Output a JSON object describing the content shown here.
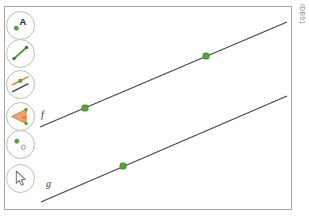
{
  "figure_id": "IDB91",
  "toolbar": {
    "tools": [
      {
        "name": "point-tool",
        "icon": "point-with-label-icon",
        "label": "A"
      },
      {
        "name": "segment-tool",
        "icon": "segment-icon",
        "label": ""
      },
      {
        "name": "parallel-line-tool",
        "icon": "parallel-lines-icon",
        "label": ""
      },
      {
        "name": "angle-tool",
        "icon": "angle-icon",
        "label": "α"
      },
      {
        "name": "point-on-object-tool",
        "icon": "point-on-object-icon",
        "label": ""
      },
      {
        "name": "move-tool",
        "icon": "cursor-arrow-icon",
        "label": ""
      }
    ]
  },
  "canvas": {
    "lines": [
      {
        "label": "f",
        "x1": 40,
        "y1": 127,
        "x2": 287,
        "y2": 22,
        "label_x": 41,
        "label_y": 118
      },
      {
        "label": "g",
        "x1": 41,
        "y1": 202,
        "x2": 287,
        "y2": 96,
        "label_x": 46,
        "label_y": 187
      }
    ],
    "points": [
      {
        "on": "f",
        "x": 85,
        "y": 108
      },
      {
        "on": "f",
        "x": 206,
        "y": 56
      },
      {
        "on": "g",
        "x": 123,
        "y": 166
      }
    ],
    "colors": {
      "line": "#474747",
      "point_fill": "#55a339",
      "point_stroke": "#39821f",
      "accent_green": "#4ea33c",
      "accent_orange": "#e0813f"
    }
  }
}
